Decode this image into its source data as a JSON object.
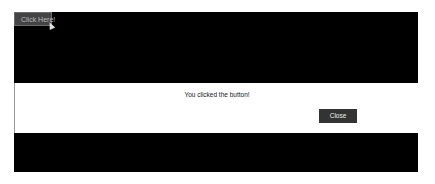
{
  "page": {
    "open_button_label": "Click Here!",
    "cursor_icon": "arrow-cursor"
  },
  "modal": {
    "message": "You clicked the button!",
    "close_label": "Close"
  },
  "colors": {
    "backdrop": "#000000",
    "modal_bg": "#ffffff",
    "close_button_bg": "#333333"
  }
}
